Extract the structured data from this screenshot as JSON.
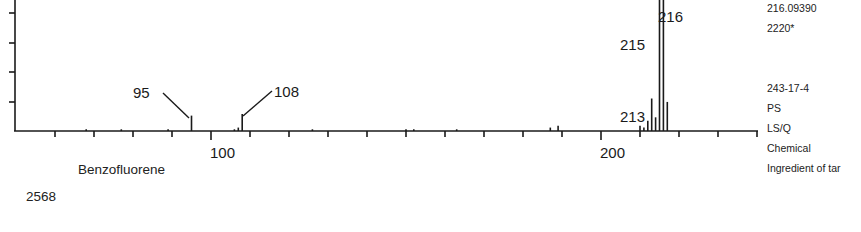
{
  "chart_data": {
    "type": "bar",
    "title": "Benzofluorene",
    "xlabel": "",
    "ylabel": "",
    "xlim": [
      50,
      240
    ],
    "ylim": [
      0,
      100
    ],
    "x_ticks_major": [
      100,
      200
    ],
    "x_tick_labels": [
      "100",
      "200"
    ],
    "x_minor_step": 10,
    "grid": false,
    "legend": null,
    "peaks": [
      {
        "mz": 68,
        "intensity": 1
      },
      {
        "mz": 77,
        "intensity": 1
      },
      {
        "mz": 89,
        "intensity": 1
      },
      {
        "mz": 95,
        "intensity": 9,
        "label": "95"
      },
      {
        "mz": 106,
        "intensity": 1
      },
      {
        "mz": 107,
        "intensity": 2
      },
      {
        "mz": 108,
        "intensity": 10,
        "label": "108"
      },
      {
        "mz": 126,
        "intensity": 1
      },
      {
        "mz": 150,
        "intensity": 1
      },
      {
        "mz": 152,
        "intensity": 1
      },
      {
        "mz": 163,
        "intensity": 1
      },
      {
        "mz": 187,
        "intensity": 2
      },
      {
        "mz": 189,
        "intensity": 3
      },
      {
        "mz": 210,
        "intensity": 3
      },
      {
        "mz": 211,
        "intensity": 2
      },
      {
        "mz": 212,
        "intensity": 6
      },
      {
        "mz": 213,
        "intensity": 19,
        "label": "213"
      },
      {
        "mz": 214,
        "intensity": 8
      },
      {
        "mz": 215,
        "intensity": 77,
        "label": "215"
      },
      {
        "mz": 216,
        "intensity": 100,
        "label": "216"
      },
      {
        "mz": 217,
        "intensity": 17
      }
    ],
    "annotations": [
      "95",
      "108",
      "213",
      "215",
      "216"
    ]
  },
  "compound": {
    "name": "Benzofluorene",
    "index": "2568"
  },
  "info_panel": {
    "exact_mass": "216.09390",
    "ri": "2220*",
    "cas": "243-17-4",
    "type": "PS",
    "class": "LS/Q",
    "category": "Chemical",
    "note": "Ingredient of tar"
  }
}
